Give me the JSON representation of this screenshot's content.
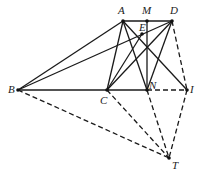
{
  "diagram": {
    "points": {
      "A": {
        "label": "A",
        "x": 123,
        "y": 21
      },
      "M": {
        "label": "M",
        "x": 147,
        "y": 21
      },
      "D": {
        "label": "D",
        "x": 172,
        "y": 21
      },
      "E": {
        "label": "E",
        "x": 142,
        "y": 34
      },
      "B": {
        "label": "B",
        "x": 18,
        "y": 90
      },
      "C": {
        "label": "C",
        "x": 107,
        "y": 90
      },
      "N": {
        "label": "N",
        "x": 147,
        "y": 90
      },
      "I": {
        "label": "I",
        "x": 187,
        "y": 90
      },
      "T": {
        "label": "T",
        "x": 169,
        "y": 158
      }
    },
    "solid_segments": [
      [
        "A",
        "D"
      ],
      [
        "B",
        "A"
      ],
      [
        "B",
        "D"
      ],
      [
        "B",
        "N"
      ],
      [
        "A",
        "C"
      ],
      [
        "A",
        "N"
      ],
      [
        "A",
        "I"
      ],
      [
        "D",
        "C"
      ],
      [
        "D",
        "N"
      ],
      [
        "C",
        "E"
      ],
      [
        "M",
        "N"
      ]
    ],
    "dashed_segments": [
      [
        "N",
        "I"
      ],
      [
        "D",
        "I"
      ],
      [
        "B",
        "T"
      ],
      [
        "C",
        "T"
      ],
      [
        "N",
        "T"
      ],
      [
        "I",
        "T"
      ]
    ]
  }
}
